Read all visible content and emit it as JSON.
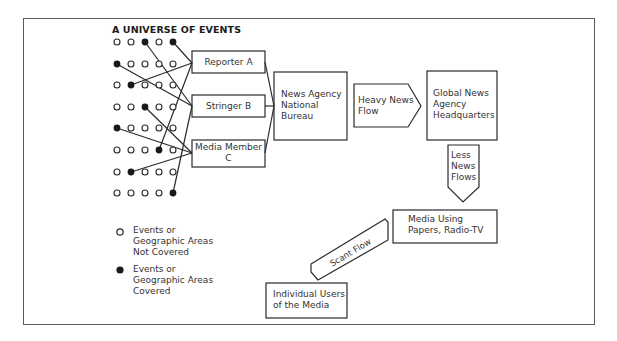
{
  "title": "A UNIVERSE OF EVENTS",
  "colors": {
    "line": "#2a2a2a",
    "frame": "#5a5a5a",
    "background": "#ffffff"
  },
  "dot_grid": {
    "columns_x": [
      117,
      131,
      145,
      159,
      173
    ],
    "rows_y": [
      42,
      64,
      85,
      107,
      128,
      150,
      172,
      193
    ],
    "rows": [
      [
        0,
        0,
        1,
        0,
        1
      ],
      [
        1,
        0,
        0,
        0,
        0
      ],
      [
        0,
        1,
        0,
        0,
        0
      ],
      [
        0,
        0,
        1,
        0,
        0
      ],
      [
        1,
        0,
        0,
        0,
        0
      ],
      [
        0,
        0,
        0,
        1,
        0
      ],
      [
        0,
        1,
        0,
        0,
        0
      ],
      [
        0,
        0,
        0,
        0,
        1
      ]
    ]
  },
  "nodes": {
    "reporter_a": "Reporter A",
    "stringer_b": "Stringer B",
    "media_member_c_line1": "Media Member",
    "media_member_c_line2": "C",
    "national_bureau_line1": "News Agency",
    "national_bureau_line2": "National",
    "national_bureau_line3": "Bureau",
    "global_hq_line1": "Global News",
    "global_hq_line2": "Agency",
    "global_hq_line3": "Headquarters",
    "media_using_line1": "Media Using",
    "media_using_line2": "Papers, Radio-TV",
    "individual_users_line1": "Individual Users",
    "individual_users_line2": "of the Media"
  },
  "flows": {
    "heavy_line1": "Heavy News",
    "heavy_line2": "Flow",
    "less_line1": "Less",
    "less_line2": "News",
    "less_line3": "Flows",
    "scant": "Scant Flow"
  },
  "legend": {
    "not_covered_line1": "Events or",
    "not_covered_line2": "Geographic Areas",
    "not_covered_line3": "Not Covered",
    "covered_line1": "Events or",
    "covered_line2": "Geographic Areas",
    "covered_line3": "Covered"
  }
}
